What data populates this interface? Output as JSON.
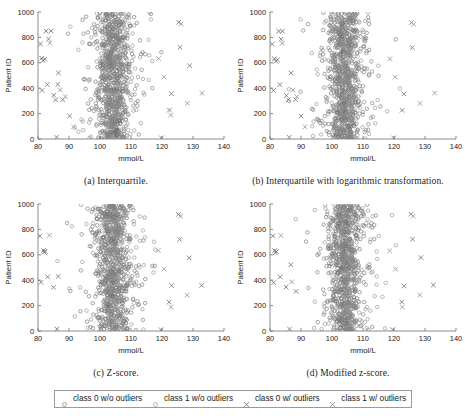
{
  "figure": {
    "background": "#ffffff",
    "axis_color": "#6e6e6e",
    "text_color": "#202020"
  },
  "chart_data": [
    {
      "id": "a",
      "type": "scatter",
      "title": "",
      "caption": "(a) Interquartile.",
      "xlabel": "mmol/L",
      "ylabel": "Patient ID",
      "xlim": [
        80,
        140
      ],
      "ylim": [
        0,
        1000
      ],
      "xticks": [
        80,
        90,
        100,
        110,
        120,
        130,
        140
      ],
      "yticks": [
        0,
        200,
        400,
        600,
        800,
        1000
      ],
      "grid": false,
      "series": [
        {
          "name": "class 0 w/o outliers",
          "marker": "circle",
          "color": "#6b6b6b",
          "n_points": 520,
          "x_center": 104.0,
          "x_spread": 4.2,
          "seed": 101
        },
        {
          "name": "class 1 w/o outliers",
          "marker": "circle",
          "color": "#8a8a8a",
          "n_points": 430,
          "x_center": 104.6,
          "x_spread": 4.6,
          "seed": 202
        },
        {
          "name": "class 0 w/ outliers",
          "marker": "cross",
          "color": "#7c7c7c",
          "n_points": 22,
          "seed": 303,
          "points": [
            [
              80.8,
              748
            ],
            [
              81.2,
              636
            ],
            [
              81.6,
              618
            ],
            [
              82.2,
              628
            ],
            [
              82.6,
              850
            ],
            [
              84.2,
              851
            ],
            [
              83.4,
              787
            ],
            [
              83.0,
              429
            ],
            [
              81.3,
              383
            ],
            [
              85.1,
              345
            ],
            [
              85.7,
              308
            ],
            [
              86.0,
              14
            ],
            [
              86.6,
              521
            ],
            [
              88.0,
              310
            ],
            [
              90.2,
              182
            ],
            [
              86.4,
              430
            ],
            [
              119.8,
              9
            ],
            [
              122.4,
              228
            ],
            [
              123.0,
              357
            ],
            [
              125.4,
              919
            ],
            [
              125.8,
              722
            ],
            [
              128.9,
              577
            ]
          ]
        },
        {
          "name": "class 1 w/ outliers",
          "marker": "cross",
          "color": "#9b9b9b",
          "n_points": 10,
          "seed": 404,
          "points": [
            [
              83.8,
              755
            ],
            [
              87.2,
              386
            ],
            [
              88.8,
              334
            ],
            [
              91.5,
              97
            ],
            [
              118.9,
              633
            ],
            [
              120.6,
              489
            ],
            [
              122.8,
              188
            ],
            [
              128.2,
              281
            ],
            [
              132.9,
              360
            ],
            [
              126.1,
              905
            ]
          ]
        }
      ]
    },
    {
      "id": "b",
      "type": "scatter",
      "title": "",
      "caption": "(b) Interquartile with logarithmic transformation.",
      "xlabel": "mmol/L",
      "ylabel": "Patient ID",
      "xlim": [
        80,
        140
      ],
      "ylim": [
        0,
        1000
      ],
      "xticks": [
        80,
        90,
        100,
        110,
        120,
        130,
        140
      ],
      "yticks": [
        0,
        200,
        400,
        600,
        800,
        1000
      ],
      "grid": false,
      "series": [
        {
          "name": "class 0 w/o outliers",
          "marker": "circle",
          "color": "#6b6b6b",
          "n_points": 520,
          "x_center": 104.0,
          "x_spread": 4.2,
          "seed": 111
        },
        {
          "name": "class 1 w/o outliers",
          "marker": "circle",
          "color": "#8a8a8a",
          "n_points": 430,
          "x_center": 104.6,
          "x_spread": 4.6,
          "seed": 212
        },
        {
          "name": "class 0 w/ outliers",
          "marker": "cross",
          "color": "#7c7c7c",
          "n_points": 20,
          "seed": 313,
          "points": [
            [
              80.7,
              746
            ],
            [
              81.4,
              631
            ],
            [
              81.9,
              612
            ],
            [
              82.4,
              624
            ],
            [
              82.8,
              848
            ],
            [
              84.0,
              849
            ],
            [
              83.6,
              786
            ],
            [
              83.2,
              428
            ],
            [
              81.1,
              382
            ],
            [
              85.3,
              343
            ],
            [
              85.9,
              309
            ],
            [
              86.2,
              13
            ],
            [
              86.8,
              520
            ],
            [
              88.2,
              311
            ],
            [
              90.0,
              180
            ],
            [
              119.9,
              8
            ],
            [
              122.6,
              226
            ],
            [
              123.2,
              356
            ],
            [
              125.6,
              917
            ],
            [
              125.9,
              720
            ]
          ]
        },
        {
          "name": "class 1 w/ outliers",
          "marker": "cross",
          "color": "#9b9b9b",
          "n_points": 9,
          "seed": 414,
          "points": [
            [
              83.9,
              753
            ],
            [
              87.4,
              385
            ],
            [
              88.6,
              333
            ],
            [
              91.3,
              96
            ],
            [
              118.7,
              632
            ],
            [
              120.4,
              487
            ],
            [
              128.4,
              280
            ],
            [
              133.1,
              361
            ],
            [
              126.3,
              903
            ]
          ]
        }
      ]
    },
    {
      "id": "c",
      "type": "scatter",
      "title": "",
      "caption": "(c) Z-score.",
      "xlabel": "mmol/L",
      "ylabel": "Patient ID",
      "xlim": [
        80,
        140
      ],
      "ylim": [
        0,
        1000
      ],
      "xticks": [
        80,
        90,
        100,
        110,
        120,
        130,
        140
      ],
      "yticks": [
        0,
        200,
        400,
        600,
        800,
        1000
      ],
      "grid": false,
      "series": [
        {
          "name": "class 0 w/o outliers",
          "marker": "circle",
          "color": "#6b6b6b",
          "n_points": 520,
          "x_center": 104.0,
          "x_spread": 4.2,
          "seed": 121
        },
        {
          "name": "class 1 w/o outliers",
          "marker": "circle",
          "color": "#8a8a8a",
          "n_points": 430,
          "x_center": 104.6,
          "x_spread": 4.6,
          "seed": 222
        },
        {
          "name": "class 0 w/ outliers",
          "marker": "cross",
          "color": "#7c7c7c",
          "n_points": 16,
          "seed": 323,
          "points": [
            [
              80.6,
              747
            ],
            [
              81.8,
              634
            ],
            [
              82.0,
              620
            ],
            [
              82.3,
              627
            ],
            [
              81.0,
              384
            ],
            [
              85.0,
              344
            ],
            [
              86.1,
              15
            ],
            [
              86.5,
              430
            ],
            [
              83.1,
              427
            ],
            [
              119.7,
              10
            ],
            [
              122.3,
              227
            ],
            [
              123.1,
              358
            ],
            [
              125.3,
              918
            ],
            [
              125.7,
              721
            ],
            [
              128.8,
              576
            ],
            [
              132.8,
              359
            ]
          ]
        },
        {
          "name": "class 1 w/ outliers",
          "marker": "cross",
          "color": "#9b9b9b",
          "n_points": 6,
          "seed": 424,
          "points": [
            [
              83.7,
              754
            ],
            [
              120.7,
              488
            ],
            [
              122.9,
              187
            ],
            [
              128.1,
              282
            ],
            [
              126.0,
              906
            ],
            [
              118.8,
              634
            ]
          ]
        }
      ]
    },
    {
      "id": "d",
      "type": "scatter",
      "title": "",
      "caption": "(d) Modified z-score.",
      "xlabel": "mmol/L",
      "ylabel": "Patient ID",
      "xlim": [
        80,
        140
      ],
      "ylim": [
        0,
        1000
      ],
      "xticks": [
        80,
        90,
        100,
        110,
        120,
        130,
        140
      ],
      "yticks": [
        0,
        200,
        400,
        600,
        800,
        1000
      ],
      "grid": false,
      "series": [
        {
          "name": "class 0 w/o outliers",
          "marker": "circle",
          "color": "#6b6b6b",
          "n_points": 520,
          "x_center": 104.0,
          "x_spread": 4.2,
          "seed": 131
        },
        {
          "name": "class 1 w/o outliers",
          "marker": "circle",
          "color": "#8a8a8a",
          "n_points": 430,
          "x_center": 104.6,
          "x_spread": 4.6,
          "seed": 232
        },
        {
          "name": "class 0 w/ outliers",
          "marker": "cross",
          "color": "#7c7c7c",
          "n_points": 17,
          "seed": 333,
          "points": [
            [
              80.9,
              749
            ],
            [
              81.5,
              633
            ],
            [
              81.7,
              616
            ],
            [
              82.1,
              626
            ],
            [
              81.2,
              381
            ],
            [
              85.2,
              346
            ],
            [
              86.3,
              16
            ],
            [
              86.7,
              522
            ],
            [
              83.3,
              426
            ],
            [
              88.4,
              312
            ],
            [
              119.6,
              11
            ],
            [
              122.5,
              229
            ],
            [
              123.3,
              355
            ],
            [
              125.5,
              920
            ],
            [
              126.0,
              723
            ],
            [
              128.7,
              578
            ],
            [
              132.7,
              362
            ]
          ]
        },
        {
          "name": "class 1 w/ outliers",
          "marker": "cross",
          "color": "#9b9b9b",
          "n_points": 7,
          "seed": 434,
          "points": [
            [
              83.5,
              752
            ],
            [
              87.0,
              387
            ],
            [
              120.5,
              486
            ],
            [
              122.7,
              189
            ],
            [
              128.3,
              283
            ],
            [
              126.2,
              904
            ],
            [
              118.6,
              631
            ]
          ]
        }
      ]
    }
  ],
  "legend": {
    "entries": [
      {
        "label": "class 0 w/o outliers",
        "marker": "circle",
        "color": "#7f7f7f"
      },
      {
        "label": "class 1 w/o outliers",
        "marker": "circle",
        "color": "#9a9a9a"
      },
      {
        "label": "class 0 w/ outliers",
        "marker": "cross",
        "color": "#7f7f7f"
      },
      {
        "label": "class 1 w/ outliers",
        "marker": "cross",
        "color": "#9a9a9a"
      }
    ]
  }
}
